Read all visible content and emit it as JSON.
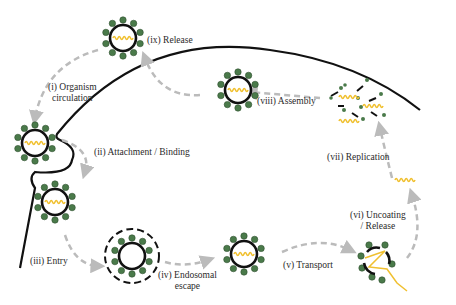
{
  "diagram": {
    "colors": {
      "membrane": "#111111",
      "spike": "#4a7a4a",
      "spike_stroke": "#2f4f2f",
      "genome": "#f0c030",
      "arrow": "#bbbbbb",
      "text": "#2a2a2a"
    },
    "steps": [
      {
        "id": "i",
        "label_line1": "(i) Organism",
        "label_line2": "circulation"
      },
      {
        "id": "ii",
        "label_line1": "(ii) Attachment / Binding"
      },
      {
        "id": "iii",
        "label_line1": "(iii) Entry"
      },
      {
        "id": "iv",
        "label_line1": "(iv) Endosomal",
        "label_line2": "escape"
      },
      {
        "id": "v",
        "label_line1": "(v) Transport"
      },
      {
        "id": "vi",
        "label_line1": "(vi) Uncoating",
        "label_line2": "/ Release"
      },
      {
        "id": "vii",
        "label_line1": "(vii) Replication"
      },
      {
        "id": "viii",
        "label_line1": "(viii) Assembly"
      },
      {
        "id": "ix",
        "label_line1": "(ix) Release"
      }
    ]
  }
}
